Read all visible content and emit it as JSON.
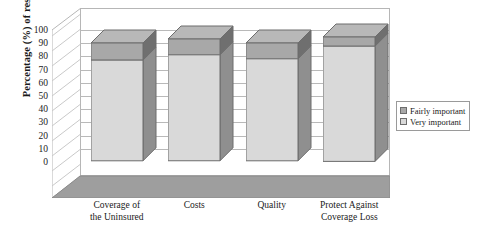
{
  "chart_data": {
    "type": "bar",
    "subtype": "stacked-3d-column",
    "title": "",
    "xlabel": "",
    "ylabel": "Percentage (%) of respondents",
    "ylim": [
      0,
      100
    ],
    "ytick_step": 10,
    "yticks": [
      "100",
      "90",
      "80",
      "70",
      "60",
      "50",
      "40",
      "30",
      "20",
      "10",
      "0"
    ],
    "grid": true,
    "legend_position": "right",
    "categories": [
      "Coverage of the Uninsured",
      "Costs",
      "Quality",
      "Protect Against Coverage Loss"
    ],
    "category_lines": [
      [
        "Coverage of",
        "the Uninsured"
      ],
      [
        "Costs",
        ""
      ],
      [
        "Quality",
        ""
      ],
      [
        "Protect Against",
        "Coverage Loss"
      ]
    ],
    "series": [
      {
        "name": "Very important",
        "values": [
          77,
          81,
          78,
          88
        ],
        "color": "#d9d9d9"
      },
      {
        "name": "Fairly important",
        "values": [
          13,
          12,
          12,
          7
        ],
        "color": "#a8a8a8"
      }
    ],
    "totals": [
      90,
      93,
      90,
      95
    ]
  },
  "legend": {
    "items": [
      {
        "label": "Fairly important",
        "swatch": "#a8a8a8"
      },
      {
        "label": "Very important",
        "swatch": "#d9d9d9"
      }
    ]
  },
  "colors": {
    "very_important_face": "#d9d9d9",
    "fairly_important_face": "#a8a8a8",
    "very_important_side": "#8f8f8f",
    "fairly_important_side": "#6f6f6f",
    "floor": "#9e9e9e",
    "gridline": "#b9b9b9",
    "outline": "#6d6d6d",
    "background": "#ffffff"
  }
}
